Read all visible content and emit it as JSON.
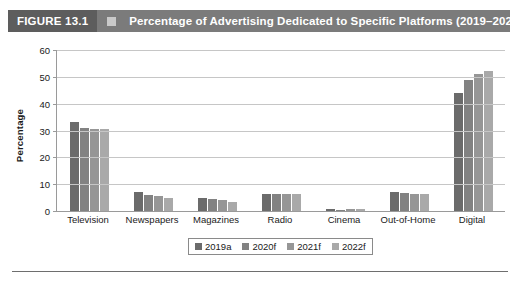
{
  "header": {
    "figure_number": "FIGURE 13.1",
    "marker_icon": "square-marker-icon",
    "title": "Percentage of Advertising Dedicated to Specific Platforms (2019–2022)",
    "bar_color": "#7b7b7b",
    "number_block_color": "#5d5d5d",
    "text_color": "#ffffff"
  },
  "chart_data": {
    "type": "bar",
    "title": "Percentage of Advertising Dedicated to Specific Platforms (2019–2022)",
    "xlabel": "",
    "ylabel": "Percentage",
    "ylim": [
      0,
      60
    ],
    "yticks": [
      0,
      10,
      20,
      30,
      40,
      50,
      60
    ],
    "ytick_labels": [
      "0",
      "10",
      "20",
      "30",
      "40",
      "50",
      "60"
    ],
    "grid": true,
    "legend_position": "bottom",
    "categories": [
      "Television",
      "Newspapers",
      "Magazines",
      "Radio",
      "Cinema",
      "Out-of-Home",
      "Digital"
    ],
    "series": [
      {
        "name": "2019a",
        "color": "#6b6b6b",
        "values": [
          33,
          7,
          5,
          6.5,
          0.8,
          7,
          44
        ]
      },
      {
        "name": "2020f",
        "color": "#828282",
        "values": [
          31,
          6,
          4.5,
          6.5,
          0.5,
          6.8,
          49
        ]
      },
      {
        "name": "2021f",
        "color": "#969696",
        "values": [
          30.5,
          5.5,
          4,
          6.5,
          0.6,
          6.5,
          51
        ]
      },
      {
        "name": "2022f",
        "color": "#a9a9a9",
        "values": [
          30.5,
          5,
          3.5,
          6.5,
          0.7,
          6.3,
          52
        ]
      }
    ]
  },
  "legend": {
    "items": [
      {
        "label": "2019a",
        "color": "#6b6b6b"
      },
      {
        "label": "2020f",
        "color": "#828282"
      },
      {
        "label": "2021f",
        "color": "#969696"
      },
      {
        "label": "2022f",
        "color": "#a9a9a9"
      }
    ]
  }
}
